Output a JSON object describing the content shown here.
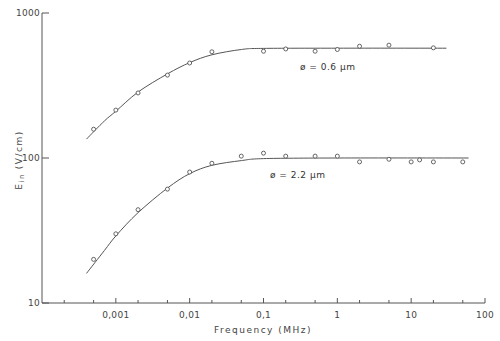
{
  "chart_data": {
    "type": "scatter",
    "title": "",
    "xlabel": "Frequency (MHz)",
    "ylabel": "E_in (V/cm)",
    "ylabel_main": "E",
    "ylabel_sub": "in",
    "ylabel_unit": "(V/cm)",
    "xscale": "log",
    "yscale": "log",
    "xlim": [
      0.0001,
      100
    ],
    "ylim": [
      10,
      1000
    ],
    "grid": false,
    "x_ticks": [
      0.001,
      0.01,
      0.1,
      1,
      10,
      100
    ],
    "x_tick_labels": [
      "0,001",
      "0,01",
      "0,1",
      "1",
      "10",
      "100"
    ],
    "x_minor_ticks": [
      0.0002,
      0.0005,
      0.002,
      0.005,
      0.02,
      0.05,
      0.2,
      0.5,
      2,
      5,
      20,
      50
    ],
    "y_ticks": [
      10,
      100,
      1000
    ],
    "y_tick_labels": [
      "10",
      "100",
      "1000"
    ],
    "series": [
      {
        "name": "ø = 0.6 µm",
        "label": "ø = 0.6 µm",
        "marker": "open-circle",
        "points": [
          [
            0.0005,
            158
          ],
          [
            0.001,
            214
          ],
          [
            0.002,
            281
          ],
          [
            0.005,
            373
          ],
          [
            0.01,
            452
          ],
          [
            0.02,
            540
          ],
          [
            0.1,
            545
          ],
          [
            0.2,
            565
          ],
          [
            0.5,
            545
          ],
          [
            1,
            560
          ],
          [
            2,
            590
          ],
          [
            5,
            600
          ],
          [
            20,
            575
          ]
        ],
        "fit_curve": [
          [
            0.0004,
            135
          ],
          [
            0.0007,
            180
          ],
          [
            0.001,
            210
          ],
          [
            0.002,
            285
          ],
          [
            0.005,
            380
          ],
          [
            0.01,
            455
          ],
          [
            0.02,
            515
          ],
          [
            0.05,
            560
          ],
          [
            0.1,
            570
          ],
          [
            1,
            572
          ],
          [
            30,
            572
          ]
        ]
      },
      {
        "name": "ø = 2.2 µm",
        "label": "ø = 2.2 µm",
        "marker": "open-circle",
        "points": [
          [
            0.0005,
            20
          ],
          [
            0.001,
            30
          ],
          [
            0.002,
            44
          ],
          [
            0.005,
            61
          ],
          [
            0.01,
            80
          ],
          [
            0.02,
            92
          ],
          [
            0.05,
            103
          ],
          [
            0.1,
            108
          ],
          [
            0.2,
            103
          ],
          [
            0.5,
            103
          ],
          [
            1,
            103
          ],
          [
            2,
            94
          ],
          [
            5,
            98
          ],
          [
            10,
            94
          ],
          [
            13,
            97
          ],
          [
            20,
            94
          ],
          [
            50,
            94
          ]
        ],
        "fit_curve": [
          [
            0.0004,
            16
          ],
          [
            0.0007,
            23
          ],
          [
            0.001,
            29
          ],
          [
            0.002,
            42
          ],
          [
            0.005,
            62
          ],
          [
            0.01,
            78
          ],
          [
            0.02,
            89
          ],
          [
            0.05,
            96
          ],
          [
            0.1,
            99
          ],
          [
            1,
            100
          ],
          [
            60,
            100
          ]
        ]
      }
    ],
    "annotations": [
      {
        "text": "ø = 0.6 µm",
        "x": 0.5,
        "y": 420
      },
      {
        "text": "ø = 2.2 µm",
        "x": 0.2,
        "y": 78
      }
    ]
  }
}
